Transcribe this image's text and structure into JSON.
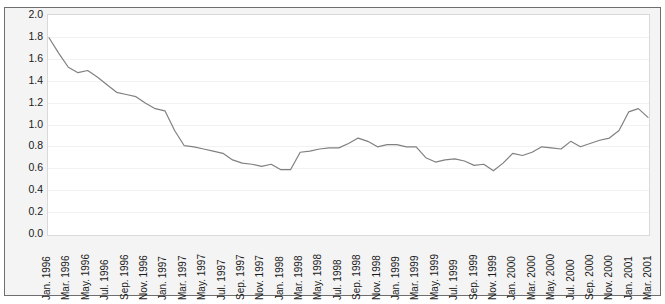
{
  "figure": {
    "top_strip_text": "",
    "line_color": "#808080",
    "plot_background": "#ffffff",
    "panel_background": "#f4f4f4",
    "frame_color": "#6e6e6e",
    "gridline_color": "#f2f2f2",
    "axis_text_color": "#1a1a1a"
  },
  "chart_data": {
    "type": "line",
    "title": "",
    "subtitle": "",
    "xlabel": "",
    "ylabel": "",
    "ylim": [
      0.0,
      2.0
    ],
    "ytick_step": 0.2,
    "grid": true,
    "legend": false,
    "legend_position": "none",
    "ytick_labels": [
      "2.0",
      "1.8",
      "1.6",
      "1.4",
      "1.2",
      "1.0",
      "0.8",
      "0.6",
      "0.4",
      "0.2",
      "0.0"
    ],
    "ytick_values": [
      2.0,
      1.8,
      1.6,
      1.4,
      1.2,
      1.0,
      0.8,
      0.6,
      0.4,
      0.2,
      0.0
    ],
    "xtick_labels": [
      "Jan. 1996",
      "Mar. 1996",
      "May. 1996",
      "Jul. 1996",
      "Sep. 1996",
      "Nov. 1996",
      "Jan. 1997",
      "Mar. 1997",
      "May. 1997",
      "Jul. 1997",
      "Sep. 1997",
      "Nov. 1997",
      "Jan. 1998",
      "Mar. 1998",
      "May. 1998",
      "Jul. 1998",
      "Sep. 1998",
      "Nov. 1998",
      "Jan. 1999",
      "Mar. 1999",
      "May. 1999",
      "Jul. 1999",
      "Sep. 1999",
      "Nov. 1999",
      "Jan. 2000",
      "Mar. 2000",
      "May. 2000",
      "Jul. 2000",
      "Sep. 2000",
      "Nov. 2000",
      "Jan. 2001",
      "Mar. 2001"
    ],
    "x": [
      "Jan. 1996",
      "Feb. 1996",
      "Mar. 1996",
      "Apr. 1996",
      "May. 1996",
      "Jun. 1996",
      "Jul. 1996",
      "Aug. 1996",
      "Sep. 1996",
      "Oct. 1996",
      "Nov. 1996",
      "Dec. 1996",
      "Jan. 1997",
      "Feb. 1997",
      "Mar. 1997",
      "Apr. 1997",
      "May. 1997",
      "Jun. 1997",
      "Jul. 1997",
      "Aug. 1997",
      "Sep. 1997",
      "Oct. 1997",
      "Nov. 1997",
      "Dec. 1997",
      "Jan. 1998",
      "Feb. 1998",
      "Mar. 1998",
      "Apr. 1998",
      "May. 1998",
      "Jun. 1998",
      "Jul. 1998",
      "Aug. 1998",
      "Sep. 1998",
      "Oct. 1998",
      "Nov. 1998",
      "Dec. 1998",
      "Jan. 1999",
      "Feb. 1999",
      "Mar. 1999",
      "Apr. 1999",
      "May. 1999",
      "Jun. 1999",
      "Jul. 1999",
      "Aug. 1999",
      "Sep. 1999",
      "Oct. 1999",
      "Nov. 1999",
      "Dec. 1999",
      "Jan. 2000",
      "Feb. 2000",
      "Mar. 2000",
      "Apr. 2000",
      "May. 2000",
      "Jun. 2000",
      "Jul. 2000",
      "Aug. 2000",
      "Sep. 2000",
      "Oct. 2000",
      "Nov. 2000",
      "Dec. 2000",
      "Jan. 2001",
      "Feb. 2001",
      "Mar. 2001"
    ],
    "values": [
      1.8,
      1.66,
      1.53,
      1.48,
      1.5,
      1.44,
      1.37,
      1.3,
      1.28,
      1.26,
      1.2,
      1.15,
      1.13,
      0.95,
      0.81,
      0.8,
      0.78,
      0.76,
      0.74,
      0.68,
      0.65,
      0.64,
      0.62,
      0.64,
      0.59,
      0.59,
      0.75,
      0.76,
      0.78,
      0.79,
      0.79,
      0.83,
      0.88,
      0.85,
      0.8,
      0.82,
      0.82,
      0.8,
      0.8,
      0.7,
      0.66,
      0.68,
      0.69,
      0.67,
      0.63,
      0.64,
      0.58,
      0.65,
      0.74,
      0.72,
      0.75,
      0.8,
      0.79,
      0.78,
      0.85,
      0.8,
      0.83,
      0.86,
      0.88,
      0.95,
      1.12,
      1.15,
      1.07
    ],
    "series": [
      {
        "name": "series-1",
        "color": "#808080",
        "values": [
          1.8,
          1.66,
          1.53,
          1.48,
          1.5,
          1.44,
          1.37,
          1.3,
          1.28,
          1.26,
          1.2,
          1.15,
          1.13,
          0.95,
          0.81,
          0.8,
          0.78,
          0.76,
          0.74,
          0.68,
          0.65,
          0.64,
          0.62,
          0.64,
          0.59,
          0.59,
          0.75,
          0.76,
          0.78,
          0.79,
          0.79,
          0.83,
          0.88,
          0.85,
          0.8,
          0.82,
          0.82,
          0.8,
          0.8,
          0.7,
          0.66,
          0.68,
          0.69,
          0.67,
          0.63,
          0.64,
          0.58,
          0.65,
          0.74,
          0.72,
          0.75,
          0.8,
          0.79,
          0.78,
          0.85,
          0.8,
          0.83,
          0.86,
          0.88,
          0.95,
          1.12,
          1.15,
          1.07
        ]
      }
    ]
  }
}
